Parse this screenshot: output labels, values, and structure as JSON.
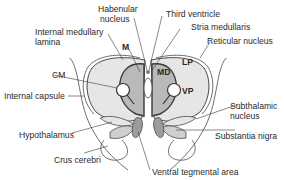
{
  "figure": {
    "type": "anatomical-diagram"
  },
  "colors": {
    "outline": "#4a4a4a",
    "light_fill": "#e6e6e6",
    "medium_fill": "#b9b9b9",
    "dark_fill": "#9c9c9c",
    "background": "#ffffff",
    "text": "#2a2a2a"
  },
  "labels": {
    "habenular_nucleus_1": "Habenular",
    "habenular_nucleus_2": "nucleus",
    "third_ventricle": "Third ventricle",
    "stria_medullaris": "Stria medullaris",
    "internal_medullary_lamina_1": "Internal medullary",
    "internal_medullary_lamina_2": "lamina",
    "reticular_nucleus": "Reticular nucleus",
    "m": "M",
    "md": "MD",
    "lp": "LP",
    "vp": "VP",
    "cm": "CM",
    "internal_capsule": "Internal capsule",
    "subthalamic_nucleus_1": "Subthalamic",
    "subthalamic_nucleus_2": "nucleus",
    "hypothalamus": "Hypothalamus",
    "substantia_nigra": "Substantia nigra",
    "crus_cerebri": "Crus cerebri",
    "ventral_tegmental_area": "Ventral tegmental area"
  }
}
